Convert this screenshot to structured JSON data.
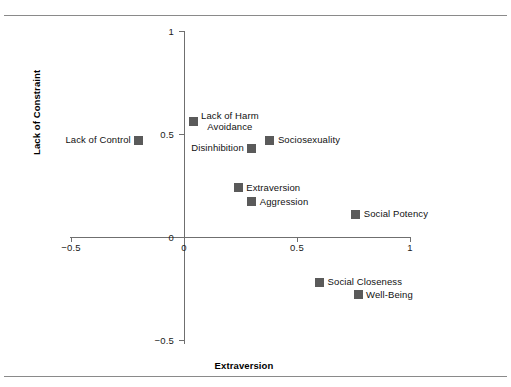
{
  "chart_data": {
    "type": "scatter",
    "title": "",
    "xlabel": "Extraversion",
    "ylabel": "Lack of Constraint",
    "xlim": [
      -0.5,
      1.0
    ],
    "ylim": [
      -0.5,
      1.0
    ],
    "xticks": [
      "-0.5",
      "0",
      "0.5",
      "1"
    ],
    "xtick_values": [
      -0.5,
      0,
      0.5,
      1
    ],
    "yticks": [
      "1",
      "0.5",
      "0",
      "-0.5"
    ],
    "ytick_values": [
      1,
      0.5,
      0,
      -0.5
    ],
    "grid": false,
    "legend": "none",
    "origin_label": "0",
    "points": [
      {
        "label": "Lack of Control",
        "x": -0.2,
        "y": 0.47,
        "label_side": "left"
      },
      {
        "label": "Lack of Harm\nAvoidance",
        "x": 0.04,
        "y": 0.56,
        "label_side": "right",
        "two_line": true,
        "line1": "Lack of Harm",
        "line2": "Avoidance"
      },
      {
        "label": "Disinhibition",
        "x": 0.3,
        "y": 0.43,
        "label_side": "left"
      },
      {
        "label": "Sociosexuality",
        "x": 0.38,
        "y": 0.47,
        "label_side": "right"
      },
      {
        "label": "Extraversion",
        "x": 0.24,
        "y": 0.24,
        "label_side": "right"
      },
      {
        "label": "Aggression",
        "x": 0.3,
        "y": 0.17,
        "label_side": "right"
      },
      {
        "label": "Social Potency",
        "x": 0.76,
        "y": 0.11,
        "label_side": "right"
      },
      {
        "label": "Social Closeness",
        "x": 0.6,
        "y": -0.22,
        "label_side": "right"
      },
      {
        "label": "Well-Being",
        "x": 0.77,
        "y": -0.28,
        "label_side": "right"
      }
    ],
    "marker_color": "#5a5a5a",
    "axis_color": "#6f6f6f"
  }
}
